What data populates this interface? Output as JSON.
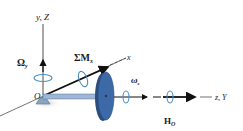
{
  "diagram": {
    "type": "gyroscope-free-body",
    "axes": {
      "vertical": "y, Z",
      "diagonal": "x",
      "horizontal": "z, Y"
    },
    "origin_label": "O",
    "labels": {
      "precession": "Ω",
      "precession_sub": "y",
      "moment": "ΣM",
      "moment_sub": "x",
      "spin": "ω",
      "spin_sub": "s",
      "angular_momentum": "H",
      "angular_momentum_sub": "O"
    },
    "colors": {
      "disk": "#3d6aa6",
      "disk_dark": "#2a4d80",
      "shaft": "#9fb6d6",
      "rotation_arrow": "#4a90c8",
      "axis": "#222222",
      "support": "#8aa5c0"
    }
  }
}
